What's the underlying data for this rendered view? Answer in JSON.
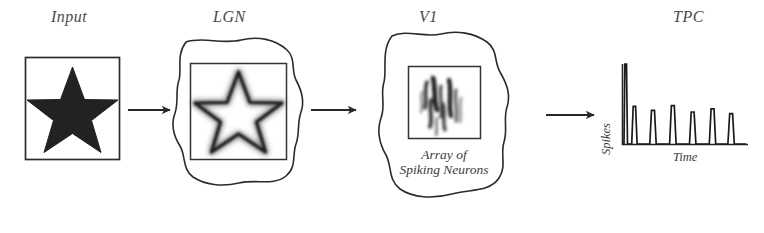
{
  "diagram": {
    "background_color": "#ffffff",
    "ink_color": "#2b2b2b",
    "label_color": "#4a4a4a"
  },
  "stages": [
    {
      "id": "input",
      "label": "Input",
      "label_x": 51,
      "label_y": 8,
      "container": "square",
      "content": "filled-star",
      "box": {
        "x": 25,
        "y": 57,
        "w": 95,
        "h": 103
      }
    },
    {
      "id": "lgn",
      "label": "LGN",
      "label_x": 213,
      "label_y": 8,
      "container": "blob",
      "content": "outline-star-blurred",
      "box": {
        "x": 190,
        "y": 63,
        "w": 97,
        "h": 97
      },
      "blob": {
        "cx": 239,
        "cy": 113,
        "rx": 63,
        "ry": 78
      }
    },
    {
      "id": "v1",
      "label": "V1",
      "label_x": 417,
      "label_y": 8,
      "container": "blob",
      "content": "gabor-array",
      "caption_lines": [
        "Array of",
        "Spiking Neurons"
      ],
      "box": {
        "x": 408,
        "y": 66,
        "w": 73,
        "h": 73
      },
      "blob": {
        "cx": 444,
        "cy": 116,
        "rx": 66,
        "ry": 86
      }
    },
    {
      "id": "tpc",
      "label": "TPC",
      "label_x": 672,
      "label_y": 8,
      "container": "plot",
      "content": "spike-train",
      "plot": {
        "x": 622,
        "y": 64,
        "w": 124,
        "h": 80
      }
    }
  ],
  "arrows": [
    {
      "id": "arrow-input-lgn",
      "x1": 128,
      "y1": 110,
      "x2": 176,
      "y2": 110
    },
    {
      "id": "arrow-lgn-v1",
      "x1": 311,
      "y1": 110,
      "x2": 362,
      "y2": 110
    },
    {
      "id": "arrow-v1-tpc",
      "x1": 546,
      "y1": 115,
      "x2": 600,
      "y2": 115
    }
  ],
  "chart_data": {
    "type": "line",
    "title": "TPC",
    "xlabel": "Time",
    "ylabel": "Spikes",
    "x_axis_label": "Time",
    "y_axis_label": "Spikes",
    "grid": false,
    "legend": false,
    "xlim": [
      0,
      100
    ],
    "ylim": [
      0,
      100
    ],
    "spikes": [
      {
        "index": 1,
        "time": 3,
        "amplitude": 100,
        "width": 1.4
      },
      {
        "index": 2,
        "time": 10,
        "amplitude": 47,
        "width": 2.2
      },
      {
        "index": 3,
        "time": 25,
        "amplitude": 42,
        "width": 2.6
      },
      {
        "index": 4,
        "time": 41,
        "amplitude": 48,
        "width": 2.6
      },
      {
        "index": 5,
        "time": 57,
        "amplitude": 40,
        "width": 2.6
      },
      {
        "index": 6,
        "time": 73,
        "amplitude": 44,
        "width": 2.6
      },
      {
        "index": 7,
        "time": 88,
        "amplitude": 38,
        "width": 2.6
      }
    ],
    "baseline": 0
  },
  "icons": {
    "star_filled": "filled-star-icon",
    "star_outline": "outline-star-icon",
    "gabor": "gabor-patch-icon",
    "arrow": "right-arrow-icon"
  }
}
